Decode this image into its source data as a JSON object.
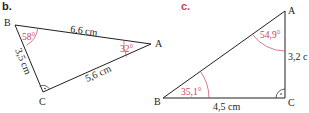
{
  "colors": {
    "line": "#231f20",
    "angle_accent": "#c8415a",
    "label_b": "#231f20",
    "label_c": "#c8415a",
    "background": "#ffffff"
  },
  "figure_b": {
    "label": "b.",
    "vertices": {
      "A": "A",
      "B": "B",
      "C": "C"
    },
    "sides": {
      "AB": "6,6 cm",
      "BC": "3,5 cm",
      "CA": "5,6 cm"
    },
    "angles": {
      "B": "58°",
      "A": "32°"
    },
    "right_angle_at": "C"
  },
  "figure_c": {
    "label": "c.",
    "vertices": {
      "A": "A",
      "B": "B",
      "C": "C"
    },
    "sides": {
      "BC": "4,5 cm",
      "CA": "3,2 c"
    },
    "angles": {
      "A": "54,9°",
      "B": "35,1°"
    },
    "right_angle_at": "C"
  }
}
